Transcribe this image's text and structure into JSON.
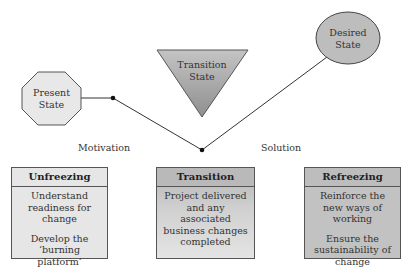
{
  "diagram": {
    "states": {
      "present": {
        "line1": "Present",
        "line2": "State"
      },
      "transition": {
        "line1": "Transition",
        "line2": "State"
      },
      "desired": {
        "line1": "Desired",
        "line2": "State"
      }
    },
    "phase_labels": {
      "motivation": "Motivation",
      "solution": "Solution"
    },
    "boxes": [
      {
        "title": "Unfreezing",
        "paragraphs": [
          "Understand readiness for change",
          "Develop the ‘burning platform’"
        ]
      },
      {
        "title": "Transition",
        "paragraphs": [
          "Project delivered and any associated business changes completed"
        ]
      },
      {
        "title": "Refreezing",
        "paragraphs": [
          "Reinforce the new ways of working",
          "Ensure the sustainability of change"
        ]
      }
    ],
    "colors": {
      "present_fill": "#e8e8e8",
      "transition_fill": "#a8a8a8",
      "desired_fill": "#bdbdbd",
      "line": "#333333"
    }
  }
}
